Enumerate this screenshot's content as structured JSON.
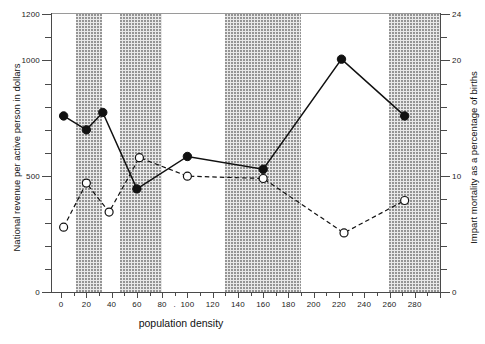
{
  "chart_data": {
    "type": "line",
    "title": "",
    "xlabel": "population density",
    "ylabel": "National revenue per active person in dollars",
    "y2label": "Impart mortality as a percentage of births",
    "xlim": [
      -8,
      300
    ],
    "ylim": [
      0,
      1200
    ],
    "y2lim": [
      0,
      24
    ],
    "grid": false,
    "legend": "none",
    "x_ticks_major": [
      0,
      20,
      40,
      60,
      80,
      100,
      120,
      140,
      160,
      180,
      200,
      220,
      240,
      260,
      280
    ],
    "x_tick_labels": [
      "0",
      "20",
      "40",
      "60",
      "80",
      ".",
      "100",
      "120",
      "140",
      "160",
      "180",
      "200",
      "220",
      "240",
      "260",
      "280"
    ],
    "y_ticks_labeled": [
      0,
      500,
      1000,
      1200
    ],
    "y_tick_labels": [
      "0",
      "500",
      "1000",
      "1200"
    ],
    "y2_ticks_labeled": [
      0,
      10,
      20,
      24
    ],
    "y2_tick_labels": [
      "0",
      "10",
      "20",
      "24"
    ],
    "shaded_bands": [
      {
        "start": 12,
        "end": 32
      },
      {
        "start": 47,
        "end": 80
      },
      {
        "start": 130,
        "end": 190
      },
      {
        "start": 260,
        "end": 300
      }
    ],
    "series": [
      {
        "name": "National revenue per active person in dollars",
        "axis": "left",
        "marker": "filled-circle",
        "line": "solid",
        "points": [
          {
            "x": 2,
            "y": 760
          },
          {
            "x": 20,
            "y": 700
          },
          {
            "x": 33,
            "y": 775
          },
          {
            "x": 60,
            "y": 445
          },
          {
            "x": 100,
            "y": 585
          },
          {
            "x": 160,
            "y": 530
          },
          {
            "x": 222,
            "y": 1005
          },
          {
            "x": 272,
            "y": 760
          }
        ]
      },
      {
        "name": "Impart mortality as a percentage of births",
        "axis": "right",
        "marker": "open-circle",
        "line": "dashed",
        "points": [
          {
            "x": 2,
            "y": 5.6
          },
          {
            "x": 20,
            "y": 9.4
          },
          {
            "x": 38,
            "y": 6.9
          },
          {
            "x": 62,
            "y": 11.6
          },
          {
            "x": 100,
            "y": 10.0
          },
          {
            "x": 160,
            "y": 9.8
          },
          {
            "x": 224,
            "y": 5.1
          },
          {
            "x": 272,
            "y": 7.9
          }
        ]
      }
    ]
  },
  "colors": {
    "ink": "#111111",
    "axis": "#4a4a4a",
    "band": "#e9e9e9",
    "band_dot": "#8f8f8f",
    "background": "#ffffff"
  }
}
